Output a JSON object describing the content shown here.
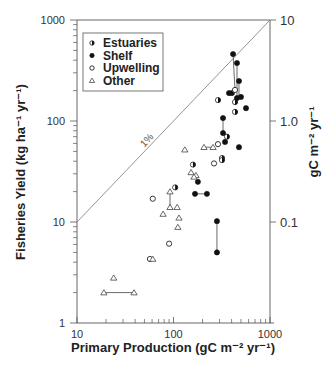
{
  "chart_data": {
    "type": "scatter",
    "title": "",
    "xlabel": "Primary Production (gC m⁻² yr⁻¹)",
    "ylabel": "Fisheries Yield (kg ha⁻¹ yr⁻¹)",
    "y2label": "gC m⁻² yr⁻¹",
    "xscale": "log",
    "yscale": "log",
    "xlim": [
      10,
      1000
    ],
    "ylim": [
      1,
      1000
    ],
    "y2lim": [
      0.01,
      10
    ],
    "xticks": [
      {
        "value": 10,
        "label": "10"
      },
      {
        "value": 100,
        "label": "100"
      },
      {
        "value": 1000,
        "label": "1000"
      }
    ],
    "yticks": [
      {
        "value": 1,
        "label": "1"
      },
      {
        "value": 10,
        "label": "10"
      },
      {
        "value": 100,
        "label": "100"
      },
      {
        "value": 1000,
        "label": "1000"
      }
    ],
    "y2ticks": [
      {
        "value": 10,
        "label": "0.1"
      },
      {
        "value": 100,
        "label": "1.0"
      },
      {
        "value": 1000,
        "label": "10"
      }
    ],
    "grid": false,
    "legend_position": "top-left",
    "reference_line": {
      "label": "1%",
      "from": [
        10,
        10
      ],
      "to": [
        1000,
        1000
      ]
    },
    "series": [
      {
        "name": "Estuaries",
        "marker": "half-filled-circle",
        "points": [
          [
            289,
            161
          ],
          [
            434,
            154
          ],
          [
            434,
            123
          ],
          [
            358,
            70
          ],
          [
            318,
            43
          ],
          [
            318,
            41
          ],
          [
            159,
            37
          ],
          [
            104,
            22
          ]
        ]
      },
      {
        "name": "Shelf",
        "marker": "filled-circle",
        "points": [
          [
            414,
            460
          ],
          [
            455,
            375
          ],
          [
            477,
            249
          ],
          [
            376,
            189
          ],
          [
            403,
            189
          ],
          [
            455,
            169
          ],
          [
            500,
            173
          ],
          [
            564,
            134
          ],
          [
            326,
            107
          ],
          [
            326,
            76
          ],
          [
            342,
            62
          ],
          [
            477,
            55
          ],
          [
            179,
            25
          ],
          [
            167,
            19
          ],
          [
            222,
            19
          ],
          [
            282,
            10.2
          ],
          [
            282,
            5.0
          ]
        ]
      },
      {
        "name": "Upwelling",
        "marker": "open-circle",
        "points": [
          [
            434,
            203
          ],
          [
            289,
            59
          ],
          [
            263,
            38
          ],
          [
            61,
            17
          ],
          [
            90,
            6.1
          ],
          [
            57,
            4.3
          ]
        ]
      },
      {
        "name": "Other",
        "marker": "open-triangle",
        "points": [
          [
            131,
            52
          ],
          [
            207,
            55
          ],
          [
            257,
            55
          ],
          [
            152,
            31
          ],
          [
            171,
            29
          ],
          [
            163,
            28
          ],
          [
            92,
            20
          ],
          [
            92,
            14
          ],
          [
            109,
            14
          ],
          [
            78,
            12
          ],
          [
            114,
            11
          ],
          [
            111,
            8.9
          ],
          [
            61,
            4.3
          ],
          [
            24,
            2.8
          ],
          [
            19,
            2.0
          ],
          [
            39,
            2.0
          ]
        ]
      }
    ],
    "connectors": [
      [
        [
          414,
          460
        ],
        [
          434,
          203
        ]
      ],
      [
        [
          455,
          375
        ],
        [
          455,
          169
        ]
      ],
      [
        [
          477,
          249
        ],
        [
          477,
          173
        ]
      ],
      [
        [
          326,
          107
        ],
        [
          326,
          76
        ]
      ],
      [
        [
          167,
          19
        ],
        [
          222,
          19
        ]
      ],
      [
        [
          282,
          10.2
        ],
        [
          282,
          5.0
        ]
      ],
      [
        [
          92,
          20
        ],
        [
          92,
          14
        ]
      ],
      [
        [
          19,
          2.0
        ],
        [
          39,
          2.0
        ]
      ],
      [
        [
          207,
          55
        ],
        [
          257,
          55
        ]
      ]
    ]
  }
}
